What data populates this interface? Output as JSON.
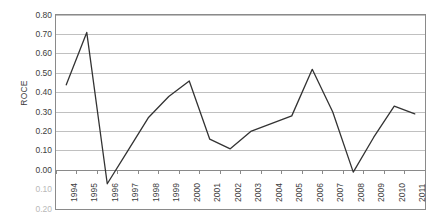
{
  "chart_data": {
    "type": "line",
    "title": "",
    "xlabel": "",
    "ylabel": "ROCE",
    "categories": [
      "1994",
      "1995",
      "1996",
      "1997",
      "1998",
      "1999",
      "2000",
      "2001",
      "2002",
      "2003",
      "2004",
      "2005",
      "2006",
      "2007",
      "2008",
      "2009",
      "2010",
      "2011"
    ],
    "values": [
      0.44,
      0.71,
      -0.07,
      0.1,
      0.27,
      0.38,
      0.46,
      0.16,
      0.11,
      0.2,
      0.24,
      0.28,
      0.52,
      0.3,
      -0.01,
      0.17,
      0.33,
      0.29
    ],
    "series": [
      {
        "name": "ROCE",
        "values": [
          0.44,
          0.71,
          -0.07,
          0.1,
          0.27,
          0.38,
          0.46,
          0.16,
          0.11,
          0.2,
          0.24,
          0.28,
          0.52,
          0.3,
          -0.01,
          0.17,
          0.33,
          0.29
        ]
      }
    ],
    "ylim": [
      -0.2,
      0.8
    ],
    "ytick_values": [
      0.8,
      0.7,
      0.6,
      0.5,
      0.4,
      0.3,
      0.2,
      0.1,
      0.0,
      -0.1,
      -0.2
    ],
    "ytick_labels": [
      "0.80",
      "0.70",
      "0.60",
      "0.50",
      "0.40",
      "0.30",
      "0.20",
      "0.10",
      "0.00",
      "0.10",
      "0.20"
    ],
    "grid": true,
    "grid_axis": "y",
    "legend": false,
    "legend_position": "none",
    "line_color": "#333333",
    "grid_color": "#c0c0c0",
    "axis_color": "#8a8a8a",
    "plot_top_value": 0.8,
    "plot_bottom_value": -0.2,
    "gridline_min": 0.0,
    "gridline_max": 0.8
  }
}
